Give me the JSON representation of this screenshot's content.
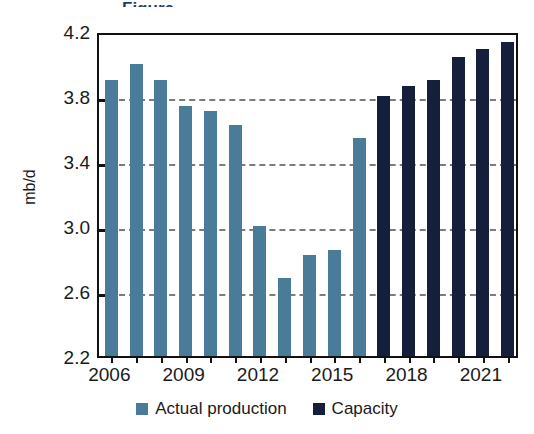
{
  "chart_data": {
    "type": "bar",
    "title": "",
    "xlabel": "",
    "ylabel": "mb/d",
    "ylim": [
      2.2,
      4.2
    ],
    "yticks": [
      2.2,
      2.6,
      3.0,
      3.4,
      3.8,
      4.2
    ],
    "ytick_labels": [
      "2.2",
      "2.6",
      "3.0",
      "3.4",
      "3.8",
      "4.2"
    ],
    "xtick_labels": [
      "2006",
      "2009",
      "2012",
      "2015",
      "2018",
      "2021"
    ],
    "xtick_categories": [
      "2006",
      "2009",
      "2012",
      "2015",
      "2018",
      "2021"
    ],
    "grid": true,
    "grid_axis": "y",
    "grid_style": "dashed",
    "legend_position": "bottom-center",
    "categories": [
      "2006",
      "2007",
      "2008",
      "2009",
      "2010",
      "2011",
      "2012",
      "2013",
      "2014",
      "2015",
      "2016",
      "2017",
      "2018",
      "2019",
      "2020",
      "2021",
      "2022"
    ],
    "series": [
      {
        "name": "Actual production",
        "color": "#4a7c99",
        "values": [
          3.9,
          4.0,
          3.9,
          3.74,
          3.71,
          3.62,
          3.0,
          2.68,
          2.82,
          2.85,
          3.54,
          null,
          null,
          null,
          null,
          null,
          null
        ]
      },
      {
        "name": "Capacity",
        "color": "#151f3c",
        "values": [
          null,
          null,
          null,
          null,
          null,
          null,
          null,
          null,
          null,
          null,
          null,
          3.8,
          3.86,
          3.9,
          4.04,
          4.09,
          4.13
        ]
      }
    ]
  },
  "axes": {
    "y_title": "mb/d",
    "y_ticks": [
      {
        "label": "4.2",
        "value": 4.2
      },
      {
        "label": "3.8",
        "value": 3.8
      },
      {
        "label": "3.4",
        "value": 3.4
      },
      {
        "label": "3.0",
        "value": 3.0
      },
      {
        "label": "2.6",
        "value": 2.6
      },
      {
        "label": "2.2",
        "value": 2.2
      }
    ],
    "x_ticks": [
      {
        "label": "2006",
        "index": 0
      },
      {
        "label": "2009",
        "index": 3
      },
      {
        "label": "2012",
        "index": 6
      },
      {
        "label": "2015",
        "index": 9
      },
      {
        "label": "2018",
        "index": 12
      },
      {
        "label": "2021",
        "index": 15
      }
    ]
  },
  "legend": {
    "items": [
      {
        "label": "Actual production",
        "color": "#4a7c99",
        "swatch": "square-swatch"
      },
      {
        "label": "Capacity",
        "color": "#151f3c",
        "swatch": "square-swatch"
      }
    ]
  },
  "title_fragment": {
    "text": "Figure",
    "color": "#1d3f6b"
  }
}
